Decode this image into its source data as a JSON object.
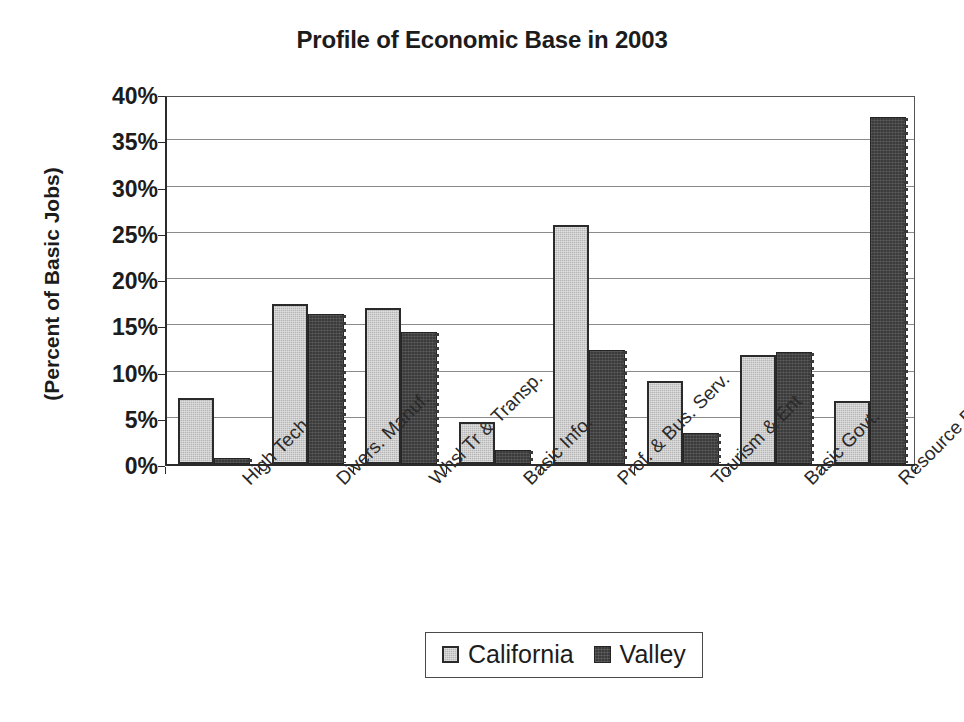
{
  "chart_data": {
    "type": "bar",
    "title": "Profile of Economic Base in 2003",
    "xlabel": "",
    "ylabel": "(Percent of Basic Jobs)",
    "ylim": [
      0,
      40
    ],
    "ytick_labels": [
      "0%",
      "5%",
      "10%",
      "15%",
      "20%",
      "25%",
      "30%",
      "35%",
      "40%"
    ],
    "ytick_values": [
      0,
      5,
      10,
      15,
      20,
      25,
      30,
      35,
      40
    ],
    "grid": "horizontal",
    "legend_position": "bottom-center",
    "categories": [
      "High Tech",
      "Divers. Manuf.",
      "Whsl Tr & Transp.",
      "Basic Info.",
      "Prof. & Bus. Serv.",
      "Tourism & Ent",
      "Basic Govt.",
      "Resource Based"
    ],
    "series": [
      {
        "name": "California",
        "color": "#b6b6b6",
        "values": [
          7.1,
          17.3,
          16.9,
          4.5,
          25.8,
          9.0,
          11.8,
          6.8
        ]
      },
      {
        "name": "Valley",
        "color": "#3b3b3b",
        "values": [
          0.7,
          16.2,
          14.3,
          1.5,
          12.3,
          3.4,
          12.1,
          37.5
        ]
      }
    ]
  },
  "legend": {
    "items": [
      {
        "label": "California",
        "swatch": "legend-swatch-california"
      },
      {
        "label": "Valley",
        "swatch": "legend-swatch-valley"
      }
    ]
  }
}
